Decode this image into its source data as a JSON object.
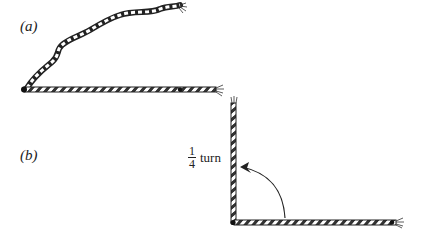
{
  "figure": {
    "panel_a": {
      "label": "(a)"
    },
    "panel_b": {
      "label": "(b)",
      "annotation": {
        "numerator": "1",
        "denominator": "4",
        "word": "turn"
      }
    }
  }
}
